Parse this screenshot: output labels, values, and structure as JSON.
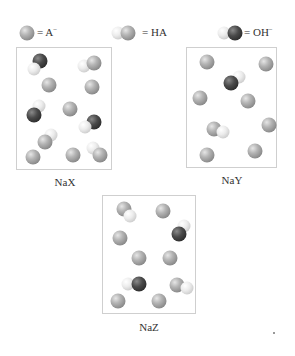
{
  "legend": {
    "a_minus": {
      "symbol": "A",
      "charge": "−",
      "prefix": "= "
    },
    "ha": {
      "text": "= HA"
    },
    "oh_minus": {
      "symbol": "OH",
      "charge": "−",
      "prefix": "= "
    }
  },
  "panels": [
    {
      "label": "NaX",
      "counts": {
        "A-": 5,
        "HA": 3,
        "OH-": 2
      }
    },
    {
      "label": "NaY",
      "counts": {
        "A-": 7,
        "HA": 1,
        "OH-": 1
      }
    },
    {
      "label": "NaZ",
      "counts": {
        "A-": 6,
        "HA": 2,
        "OH-": 2
      }
    }
  ],
  "colors": {
    "a_minus": "#9a9a9a",
    "hydrogen": "#e6e6e6",
    "oxygen": "#333333",
    "border": "#cfcfcf"
  }
}
